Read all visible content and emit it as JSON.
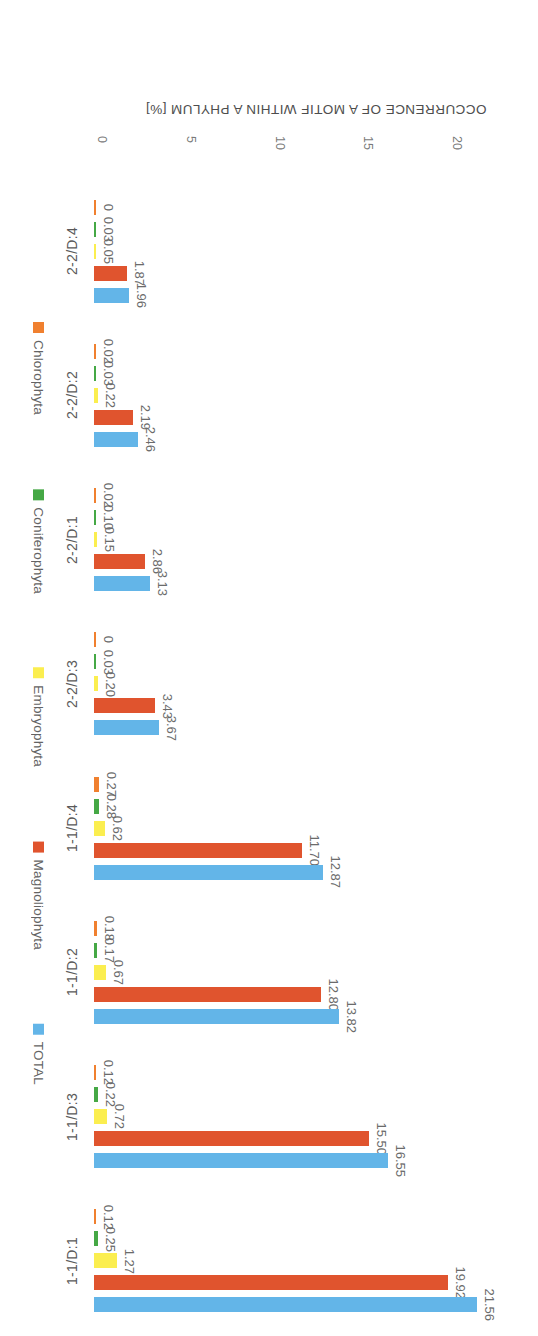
{
  "chart_data": {
    "type": "bar",
    "orientation": "horizontal",
    "title": "",
    "subtitle": "",
    "xlabel": "OCCURRENCE OF A MOTIF WITHIN A PHYLUM [%]",
    "ylabel": "",
    "xlim": [
      0,
      25
    ],
    "xticks": [
      "0",
      "5",
      "10",
      "15",
      "20",
      "25"
    ],
    "grid": false,
    "legend_position": "right",
    "value_label_format": "2 decimals",
    "categories": [
      "1-1/D:1",
      "1-1/D:3",
      "1-1/D:2",
      "1-1/D:4",
      "2-2/D:3",
      "2-2/D:1",
      "2-2/D:2",
      "2-2/D:4"
    ],
    "series": [
      {
        "name": "Chlorophyta",
        "color": "#f0802f",
        "values": [
          0.12,
          0.12,
          0.18,
          0.27,
          0.0,
          0.02,
          0.02,
          0.0
        ],
        "labels": [
          "0.12",
          "0.12",
          "0.18",
          "0.27",
          "0",
          "0.02",
          "0.02",
          "0"
        ]
      },
      {
        "name": "Coniferophyta",
        "color": "#45a845",
        "values": [
          0.25,
          0.22,
          0.17,
          0.28,
          0.03,
          0.1,
          0.03,
          0.03
        ],
        "labels": [
          "0.25",
          "0.22",
          "0.17",
          "0.28",
          "0.03",
          "0.10",
          "0.03",
          "0.03"
        ]
      },
      {
        "name": "Embryophyta",
        "color": "#fbee4f",
        "values": [
          1.27,
          0.72,
          0.67,
          0.62,
          0.2,
          0.15,
          0.22,
          0.05
        ],
        "labels": [
          "1.27",
          "0.72",
          "0.67",
          "0.62",
          "0.20",
          "0.15",
          "0.22",
          "0.05"
        ]
      },
      {
        "name": "Magnoliophyta",
        "color": "#e0542e",
        "values": [
          19.92,
          15.5,
          12.8,
          11.7,
          3.43,
          2.86,
          2.19,
          1.87
        ],
        "labels": [
          "19.92",
          "15.50",
          "12.80",
          "11.70",
          "3.43",
          "2.86",
          "2.19",
          "1.87"
        ]
      },
      {
        "name": "TOTAL",
        "color": "#63b5e8",
        "values": [
          21.56,
          16.55,
          13.82,
          12.87,
          3.67,
          3.13,
          2.46,
          1.96
        ],
        "labels": [
          "21.56",
          "16.55",
          "13.82",
          "12.87",
          "3.67",
          "3.13",
          "2.46",
          "1.96"
        ]
      }
    ]
  },
  "colors": {
    "chlorophyta": "#f0802f",
    "coniferophyta": "#45a845",
    "embryophyta": "#fbee4f",
    "magnoliophyta": "#e0542e",
    "total": "#63b5e8",
    "text": "#5a5a5a",
    "background": "#ffffff"
  }
}
